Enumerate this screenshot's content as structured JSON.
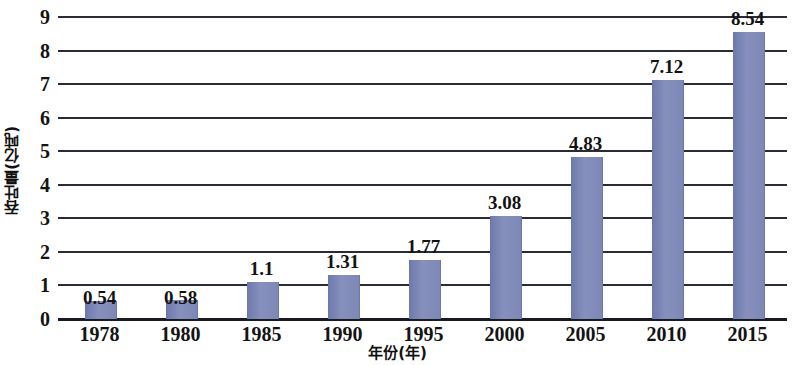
{
  "chart_data": {
    "type": "bar",
    "title": "",
    "xlabel": "年份(年)",
    "ylabel": "吞吐量(亿吨)",
    "categories": [
      "1978",
      "1980",
      "1985",
      "1990",
      "1995",
      "2000",
      "2005",
      "2010",
      "2015"
    ],
    "values": [
      0.54,
      0.58,
      1.1,
      1.31,
      1.77,
      3.08,
      4.83,
      7.12,
      8.54
    ],
    "value_labels": [
      "0.54",
      "0.58",
      "1.1",
      "1.31",
      "1.77",
      "3.08",
      "4.83",
      "7.12",
      "8.54"
    ],
    "ylim": [
      0,
      9
    ],
    "yticks": [
      0,
      1,
      2,
      3,
      4,
      5,
      6,
      7,
      8,
      9
    ],
    "ytick_labels": [
      "0",
      "1",
      "2",
      "3",
      "4",
      "5",
      "6",
      "7",
      "8",
      "9"
    ],
    "grid": true,
    "legend": null,
    "series": [
      {
        "name": "吞吐量",
        "color": "#7d88b6",
        "values": [
          0.54,
          0.58,
          1.1,
          1.31,
          1.77,
          3.08,
          4.83,
          7.12,
          8.54
        ]
      }
    ],
    "label_offsets_above_bar": [
      false,
      false,
      true,
      true,
      true,
      true,
      true,
      true,
      true
    ]
  },
  "colors": {
    "bar": "#7d88b6",
    "bar_dark": "#6e7bad",
    "bar_light": "#8790bd",
    "grid": "#2b2b33",
    "axis": "#1a1a22",
    "text": "#141414",
    "background": "#ffffff"
  }
}
